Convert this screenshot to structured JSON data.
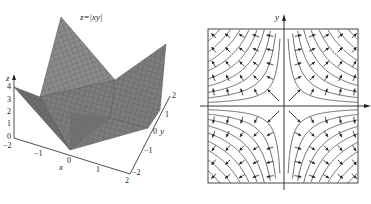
{
  "figure": {
    "left": {
      "title": "z=|xy|",
      "type": "surface3d",
      "z_axis": {
        "label": "z",
        "ticks": [
          "0",
          "1",
          "2",
          "3",
          "4"
        ]
      },
      "x_axis": {
        "label": "x",
        "ticks": [
          "−2",
          "−1",
          "0",
          "1",
          "2"
        ]
      },
      "y_axis": {
        "label": "y",
        "ticks": [
          "−2",
          "−1",
          "0",
          "1",
          "2"
        ]
      },
      "surface_color": "#7a7a7a",
      "mesh_color": "#4a4a4a"
    },
    "right": {
      "type": "vector_field",
      "x_axis_label": "x",
      "y_axis_label": "y",
      "description": "Gradient field of z=|xy| with level curves xy=c (hyperbolas) in each quadrant; arrows point away from the axes",
      "line_color": "#333333"
    }
  },
  "chart_data": [
    {
      "type": "surface3d",
      "title": "z=|xy|",
      "function": "z = |x*y|",
      "xlabel": "x",
      "ylabel": "y",
      "zlabel": "z",
      "xlim": [
        -2,
        2
      ],
      "ylim": [
        -2,
        2
      ],
      "zlim": [
        0,
        4
      ],
      "x_ticks": [
        -2,
        -1,
        0,
        1,
        2
      ],
      "y_ticks": [
        -2,
        -1,
        0,
        1,
        2
      ],
      "z_ticks": [
        0,
        1,
        2,
        3,
        4
      ],
      "corner_values": {
        "(-2,-2)": 4,
        "(-2,2)": 4,
        "(2,-2)": 4,
        "(2,2)": 4,
        "(0,0)": 0
      }
    },
    {
      "type": "vector_field",
      "xlabel": "x",
      "ylabel": "y",
      "level_curves": "|xy| = c, hyperbolas in all four quadrants",
      "arrow_direction": "gradient of |xy|, pointing away from the coordinate axes",
      "grid": false
    }
  ]
}
